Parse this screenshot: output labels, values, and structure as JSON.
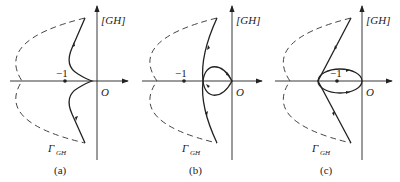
{
  "figure": {
    "panels": [
      {
        "id": "a",
        "caption": "(a)",
        "axis_label": "[GH]",
        "origin_label": "O",
        "point_label": "−1",
        "contour_label": "Γ",
        "contour_sub": "GH"
      },
      {
        "id": "b",
        "caption": "(b)",
        "axis_label": "[GH]",
        "origin_label": "O",
        "point_label": "−1",
        "contour_label": "Γ",
        "contour_sub": "GH"
      },
      {
        "id": "c",
        "caption": "(c)",
        "axis_label": "[GH]",
        "origin_label": "O",
        "point_label": "−1",
        "contour_label": "Γ",
        "contour_sub": "GH"
      }
    ],
    "colors": {
      "line": "#222222",
      "dashed": "#444444",
      "background": "#ffffff"
    }
  }
}
